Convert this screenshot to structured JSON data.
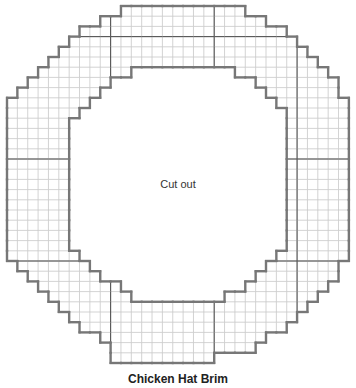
{
  "diagram": {
    "title": "Chicken Hat Brim",
    "center_label": "Cut out",
    "grid": {
      "columns": 33,
      "rows": 35,
      "outer_spans": [
        [
          11,
          23
        ],
        [
          9,
          25
        ],
        [
          7,
          27
        ],
        [
          6,
          28
        ],
        [
          5,
          29
        ],
        [
          4,
          30
        ],
        [
          3,
          31
        ],
        [
          2,
          32
        ],
        [
          1,
          32
        ],
        [
          0,
          33
        ],
        [
          0,
          33
        ],
        [
          0,
          33
        ],
        [
          0,
          33
        ],
        [
          0,
          33
        ],
        [
          0,
          33
        ],
        [
          0,
          33
        ],
        [
          0,
          33
        ],
        [
          0,
          33
        ],
        [
          0,
          33
        ],
        [
          0,
          33
        ],
        [
          0,
          33
        ],
        [
          0,
          33
        ],
        [
          0,
          33
        ],
        [
          0,
          33
        ],
        [
          0,
          33
        ],
        [
          1,
          32
        ],
        [
          2,
          32
        ],
        [
          3,
          31
        ],
        [
          4,
          30
        ],
        [
          5,
          29
        ],
        [
          6,
          28
        ],
        [
          7,
          27
        ],
        [
          9,
          25
        ],
        [
          10,
          24
        ],
        [
          10,
          20
        ]
      ],
      "inner_spans": [
        null,
        null,
        null,
        null,
        null,
        null,
        [
          12,
          22
        ],
        [
          10,
          24
        ],
        [
          9,
          25
        ],
        [
          8,
          26
        ],
        [
          7,
          27
        ],
        [
          6,
          27
        ],
        [
          6,
          27
        ],
        [
          6,
          27
        ],
        [
          6,
          27
        ],
        [
          6,
          27
        ],
        [
          6,
          27
        ],
        [
          6,
          27
        ],
        [
          6,
          27
        ],
        [
          6,
          27
        ],
        [
          6,
          27
        ],
        [
          6,
          27
        ],
        [
          6,
          27
        ],
        [
          6,
          27
        ],
        [
          7,
          26
        ],
        [
          8,
          25
        ],
        [
          9,
          24
        ],
        [
          11,
          23
        ],
        [
          12,
          21
        ],
        null,
        null,
        null,
        null,
        null,
        null
      ],
      "section_dividers": {
        "horizontal_rows": [
          3,
          15,
          25
        ],
        "vertical_cols": [
          10,
          20,
          28
        ]
      }
    },
    "colors": {
      "outline": "#777777",
      "grid_line": "#c8c8c8",
      "divider": "#555555"
    }
  }
}
